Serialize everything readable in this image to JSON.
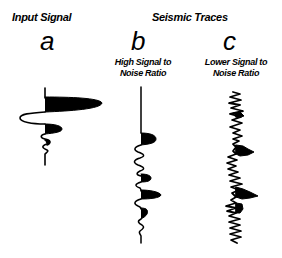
{
  "figure": {
    "input_title": "Input Signal",
    "seismic_title": "Seismic Traces",
    "panels": [
      {
        "letter": "a",
        "caption_line1": "",
        "caption_line2": ""
      },
      {
        "letter": "b",
        "caption_line1": "High Signal to",
        "caption_line2": "Noise Ratio"
      },
      {
        "letter": "c",
        "caption_line1": "Lower Signal to",
        "caption_line2": "Noise Ratio"
      }
    ]
  },
  "colors": {
    "ink": "#000000",
    "background": "#ffffff"
  }
}
